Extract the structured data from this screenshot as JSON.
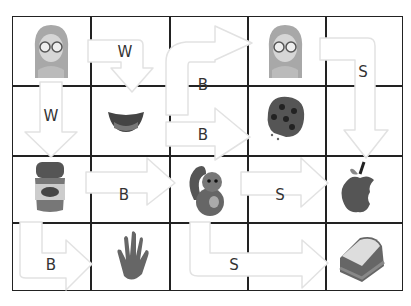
{
  "grid": {
    "columns": 5,
    "rows": 4
  },
  "cells": [
    {
      "row": 0,
      "col": 0,
      "item": "girl-with-glasses"
    },
    {
      "row": 0,
      "col": 3,
      "item": "girl-with-glasses"
    },
    {
      "row": 1,
      "col": 1,
      "item": "mouth-smile"
    },
    {
      "row": 1,
      "col": 3,
      "item": "cookie"
    },
    {
      "row": 2,
      "col": 0,
      "item": "peanut-butter-jar"
    },
    {
      "row": 2,
      "col": 2,
      "item": "squirrel"
    },
    {
      "row": 2,
      "col": 4,
      "item": "bitten-apple"
    },
    {
      "row": 3,
      "col": 1,
      "item": "hand"
    },
    {
      "row": 3,
      "col": 4,
      "item": "sandwich"
    }
  ],
  "arrows": [
    {
      "id": "a1",
      "label": "W"
    },
    {
      "id": "a2",
      "label": "W"
    },
    {
      "id": "a3",
      "label": "B"
    },
    {
      "id": "a4",
      "label": "B"
    },
    {
      "id": "a5",
      "label": "S"
    },
    {
      "id": "a6",
      "label": "B"
    },
    {
      "id": "a7",
      "label": "S"
    },
    {
      "id": "a8",
      "label": "B"
    },
    {
      "id": "a9",
      "label": "S"
    }
  ],
  "colors": {
    "grid": "#222222",
    "arrow_fill": "#ffffff",
    "arrow_stroke": "#e2e2e2",
    "label": "#333333"
  }
}
